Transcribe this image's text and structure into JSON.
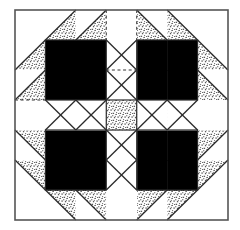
{
  "figure": {
    "name": "bears-paw-quilt-block",
    "canvas": {
      "width": 240,
      "height": 230
    },
    "block": {
      "x": 15,
      "y": 10,
      "width": 213,
      "height": 210
    },
    "grid": {
      "cols": 7,
      "rows": 7,
      "cell_width": 30.43,
      "cell_height": 30.0
    }
  },
  "colors": {
    "background": "#ffffff",
    "fabric_dark": "#000000",
    "fabric_light": "#ffffff",
    "fabric_stipple_base": "#ffffff",
    "stipple_dot": "#111111",
    "seam_line": "#2a2a2a",
    "outer_border": "#555555",
    "construction_line": "#333333"
  },
  "legend": {
    "dark_label": "dark fabric",
    "light_label": "light fabric",
    "stipple_label": "print fabric"
  },
  "units": [
    {
      "name": "paw-top-left",
      "flip_x": false,
      "flip_y": false,
      "origin_col": 0,
      "origin_row": 0
    },
    {
      "name": "paw-top-right",
      "flip_x": true,
      "flip_y": false,
      "origin_col": 4,
      "origin_row": 0
    },
    {
      "name": "paw-bottom-left",
      "flip_x": false,
      "flip_y": true,
      "origin_col": 0,
      "origin_row": 4
    },
    {
      "name": "paw-bottom-right",
      "flip_x": true,
      "flip_y": true,
      "origin_col": 4,
      "origin_row": 4
    }
  ],
  "center": {
    "name": "center-square",
    "fill": "stipple",
    "col": 3,
    "row": 3
  },
  "sashing": {
    "name": "white-cross-sashing",
    "fill": "light",
    "vertical_col": 3,
    "horizontal_row": 3
  },
  "construction_lines": [
    {
      "name": "vline-col3-top",
      "orientation": "vertical",
      "from": [
        3,
        0
      ],
      "to": [
        3,
        1
      ]
    },
    {
      "name": "vline-col4-top",
      "orientation": "vertical",
      "from": [
        4,
        0
      ],
      "to": [
        4,
        1
      ]
    },
    {
      "name": "hline-row2-center",
      "orientation": "horizontal",
      "from": [
        3,
        2
      ],
      "to": [
        4,
        2
      ]
    },
    {
      "name": "hline-row3-left",
      "orientation": "horizontal",
      "from": [
        0,
        3
      ],
      "to": [
        1,
        3
      ]
    }
  ]
}
